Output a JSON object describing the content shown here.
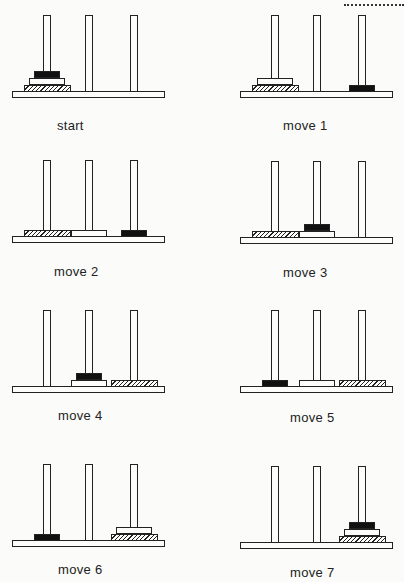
{
  "disk_sizes": [
    "small",
    "medium",
    "large"
  ],
  "disk_styles": {
    "small": "solid black",
    "medium": "white outlined",
    "large": "hatched"
  },
  "pegs": [
    "left",
    "middle",
    "right"
  ],
  "panels": [
    {
      "label": "start",
      "state": {
        "left": [
          "large",
          "medium",
          "small"
        ],
        "middle": [],
        "right": []
      }
    },
    {
      "label": "move 1",
      "state": {
        "left": [
          "large",
          "medium"
        ],
        "middle": [],
        "right": [
          "small"
        ]
      }
    },
    {
      "label": "move 2",
      "state": {
        "left": [
          "large"
        ],
        "middle": [
          "medium"
        ],
        "right": [
          "small"
        ]
      }
    },
    {
      "label": "move 3",
      "state": {
        "left": [
          "large"
        ],
        "middle": [
          "medium",
          "small"
        ],
        "right": []
      }
    },
    {
      "label": "move 4",
      "state": {
        "left": [],
        "middle": [
          "medium",
          "small"
        ],
        "right": [
          "large"
        ]
      }
    },
    {
      "label": "move 5",
      "state": {
        "left": [
          "small"
        ],
        "middle": [
          "medium"
        ],
        "right": [
          "large"
        ]
      }
    },
    {
      "label": "move 6",
      "state": {
        "left": [
          "small"
        ],
        "middle": [],
        "right": [
          "large",
          "medium"
        ]
      }
    },
    {
      "label": "move 7",
      "state": {
        "left": [],
        "middle": [],
        "right": [
          "large",
          "medium",
          "small"
        ]
      }
    }
  ]
}
